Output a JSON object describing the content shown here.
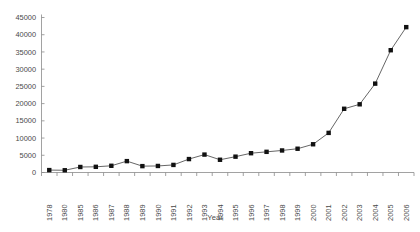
{
  "chart_data": {
    "type": "line",
    "title": "",
    "xlabel": "Year",
    "ylabel": "",
    "categories": [
      "1978",
      "1980",
      "1985",
      "1986",
      "1987",
      "1988",
      "1989",
      "1990",
      "1991",
      "1992",
      "1993",
      "1994",
      "1995",
      "1996",
      "1997",
      "1998",
      "1999",
      "2000",
      "2001",
      "2002",
      "2003",
      "2004",
      "2005",
      "2006"
    ],
    "values": [
      700,
      650,
      1600,
      1650,
      1950,
      3300,
      1850,
      1900,
      2200,
      3900,
      5200,
      3700,
      4600,
      5600,
      6000,
      6400,
      6900,
      8200,
      11500,
      18500,
      19800,
      25800,
      35500,
      42200
    ],
    "ylim": [
      0,
      45000
    ],
    "yticks": [
      0,
      5000,
      10000,
      15000,
      20000,
      25000,
      30000,
      35000,
      40000,
      45000
    ],
    "ytick_labels": [
      "0",
      "5000",
      "10000",
      "15000",
      "20000",
      "25000",
      "30000",
      "35000",
      "40000",
      "45000"
    ],
    "grid": false,
    "legend": null,
    "marker": "square",
    "marker_color": "#111111",
    "line_color": "#555555"
  },
  "axes": {
    "x_title": "Year"
  }
}
